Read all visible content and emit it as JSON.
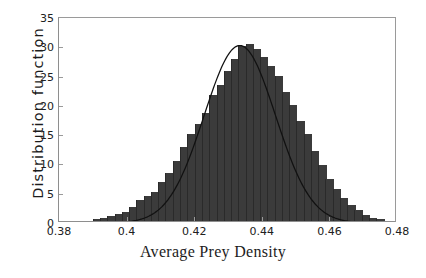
{
  "chart_data": {
    "type": "bar",
    "title": "",
    "subtitle": "",
    "xlabel": "Average Prey Density",
    "ylabel": "Distribution function",
    "xlim": [
      0.38,
      0.48
    ],
    "ylim": [
      0,
      35
    ],
    "xticks": [
      0.38,
      0.4,
      0.42,
      0.44,
      0.46,
      0.48
    ],
    "xticklabels": [
      "0.38",
      "0.4",
      "0.42",
      "0.44",
      "0.46",
      "0.48"
    ],
    "yticks": [
      0,
      5,
      10,
      15,
      20,
      25,
      30,
      35
    ],
    "yticklabels": [
      "0",
      "5",
      "10",
      "15",
      "20",
      "25",
      "30",
      "35"
    ],
    "grid": false,
    "legend": null,
    "bar_color": "#3b3b3b",
    "curve_color": "#111111",
    "bin_width": 0.00215,
    "bin_left_edges": [
      0.39,
      0.3922,
      0.3943,
      0.3965,
      0.3986,
      0.4008,
      0.4029,
      0.4051,
      0.4072,
      0.4094,
      0.4115,
      0.4137,
      0.4158,
      0.418,
      0.4201,
      0.4223,
      0.4244,
      0.4266,
      0.4287,
      0.4309,
      0.433,
      0.4352,
      0.4373,
      0.4395,
      0.4416,
      0.4438,
      0.4459,
      0.4481,
      0.4502,
      0.4524,
      0.4545,
      0.4567,
      0.4588,
      0.461,
      0.4631,
      0.4653,
      0.4674,
      0.4696,
      0.4717,
      0.4739
    ],
    "bin_centers": [
      0.3911,
      0.3932,
      0.3954,
      0.3975,
      0.3997,
      0.4018,
      0.404,
      0.4061,
      0.4083,
      0.4104,
      0.4126,
      0.4147,
      0.4169,
      0.419,
      0.4212,
      0.4233,
      0.4255,
      0.4276,
      0.4298,
      0.4319,
      0.4341,
      0.4362,
      0.4384,
      0.4405,
      0.4427,
      0.4448,
      0.447,
      0.4491,
      0.4513,
      0.4534,
      0.4556,
      0.4577,
      0.4599,
      0.462,
      0.4642,
      0.4663,
      0.4685,
      0.4706,
      0.4728,
      0.4749
    ],
    "values": [
      0.3,
      0.6,
      0.8,
      1.2,
      1.6,
      2.4,
      3.6,
      4.2,
      5.0,
      6.6,
      8.2,
      10.3,
      12.7,
      14.8,
      16.5,
      18.4,
      21.5,
      23.2,
      25.6,
      27.6,
      29.8,
      30.2,
      29.4,
      28.0,
      26.4,
      24.8,
      22.0,
      19.8,
      17.0,
      14.8,
      12.0,
      9.6,
      7.2,
      5.4,
      4.0,
      2.8,
      1.8,
      1.0,
      0.6,
      0.3
    ],
    "fit_curve": {
      "name": "normal fit",
      "kind": "gaussian",
      "mean": 0.4335,
      "sigma": 0.01055,
      "peak": 30.3,
      "color": "#111111"
    }
  }
}
